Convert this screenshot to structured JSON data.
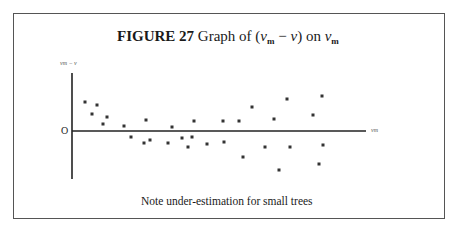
{
  "figure": {
    "label": "FIGURE 27",
    "title_prefix": "Graph of (",
    "title_var1": "v",
    "title_sub1": "m",
    "title_mid": " − ",
    "title_var2": "v",
    "title_after": ") on ",
    "title_var3": "v",
    "title_sub3": "m",
    "caption": "Note under-estimation for small trees"
  },
  "axes": {
    "y_label": "vm − v",
    "x_label": "vm",
    "origin_label": "O"
  },
  "chart_data": {
    "type": "scatter",
    "title": "FIGURE 27 Graph of (vm − v) on vm",
    "xlabel": "vm",
    "ylabel": "vm − v",
    "annotations": [
      "Note under-estimation for small trees"
    ],
    "grid": false,
    "legend": null,
    "units": "relative (no tick values shown); x = distance right of y-axis, y = height above x-axis, in px",
    "points": [
      {
        "x": 13,
        "y": 29
      },
      {
        "x": 20,
        "y": 17
      },
      {
        "x": 25,
        "y": 26
      },
      {
        "x": 31,
        "y": 8
      },
      {
        "x": 35,
        "y": 14
      },
      {
        "x": 52,
        "y": 5
      },
      {
        "x": 59,
        "y": -6
      },
      {
        "x": 72,
        "y": -12
      },
      {
        "x": 74,
        "y": 11
      },
      {
        "x": 78,
        "y": -9
      },
      {
        "x": 96,
        "y": -12
      },
      {
        "x": 100,
        "y": 4
      },
      {
        "x": 110,
        "y": -7
      },
      {
        "x": 116,
        "y": -16
      },
      {
        "x": 120,
        "y": -6
      },
      {
        "x": 122,
        "y": 10
      },
      {
        "x": 135,
        "y": -13
      },
      {
        "x": 151,
        "y": 10
      },
      {
        "x": 152,
        "y": -11
      },
      {
        "x": 167,
        "y": 10
      },
      {
        "x": 171,
        "y": -26
      },
      {
        "x": 180,
        "y": 24
      },
      {
        "x": 193,
        "y": -16
      },
      {
        "x": 202,
        "y": 12
      },
      {
        "x": 207,
        "y": -39
      },
      {
        "x": 215,
        "y": 32
      },
      {
        "x": 218,
        "y": -16
      },
      {
        "x": 241,
        "y": 16
      },
      {
        "x": 247,
        "y": -33
      },
      {
        "x": 250,
        "y": 35
      },
      {
        "x": 251,
        "y": -14
      }
    ]
  },
  "plot_px": {
    "origin": [
      72,
      131
    ],
    "y_axis_top": 73,
    "y_axis_bottom": 179,
    "x_axis_right": 366,
    "points": [
      [
        85,
        102
      ],
      [
        92,
        114
      ],
      [
        97,
        105
      ],
      [
        103,
        124
      ],
      [
        107,
        117
      ],
      [
        124,
        126
      ],
      [
        131,
        137
      ],
      [
        144,
        143
      ],
      [
        146,
        120
      ],
      [
        150,
        140
      ],
      [
        168,
        143
      ],
      [
        172,
        127
      ],
      [
        182,
        138
      ],
      [
        188,
        147
      ],
      [
        192,
        137
      ],
      [
        194,
        121
      ],
      [
        207,
        144
      ],
      [
        223,
        121
      ],
      [
        224,
        142
      ],
      [
        239,
        121
      ],
      [
        243,
        157
      ],
      [
        252,
        107
      ],
      [
        265,
        147
      ],
      [
        274,
        119
      ],
      [
        279,
        170
      ],
      [
        287,
        99
      ],
      [
        290,
        147
      ],
      [
        313,
        115
      ],
      [
        319,
        164
      ],
      [
        322,
        96
      ],
      [
        323,
        145
      ]
    ]
  }
}
